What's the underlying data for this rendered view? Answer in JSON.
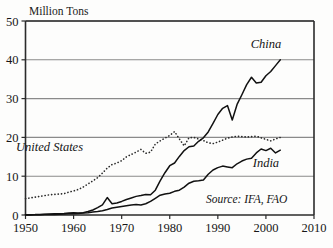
{
  "chart_data": {
    "type": "line",
    "title": "Million Tons",
    "xlabel": "",
    "ylabel": "Million Tons",
    "xlim": [
      1950,
      2010
    ],
    "ylim": [
      0,
      50
    ],
    "xticks": [
      "1950",
      "1960",
      "1970",
      "1980",
      "1990",
      "2000",
      "2010"
    ],
    "yticks": [
      "0",
      "10",
      "20",
      "30",
      "40",
      "50"
    ],
    "grid": true,
    "legend_position": "inline-annotations",
    "annotations": [
      {
        "text": "China",
        "x": 2000,
        "y": 43
      },
      {
        "text": "United States",
        "x": 1955,
        "y": 16.5
      },
      {
        "text": "India",
        "x": 2000,
        "y": 12.5
      },
      {
        "text": "Source: IFA, FAO",
        "x": 1996,
        "y": 3.0
      }
    ],
    "series": [
      {
        "name": "United States",
        "style": "dotted",
        "x": [
          1950,
          1951,
          1952,
          1953,
          1954,
          1955,
          1956,
          1957,
          1958,
          1959,
          1960,
          1961,
          1962,
          1963,
          1964,
          1965,
          1966,
          1967,
          1968,
          1969,
          1970,
          1971,
          1972,
          1973,
          1974,
          1975,
          1976,
          1977,
          1978,
          1979,
          1980,
          1981,
          1982,
          1983,
          1984,
          1985,
          1986,
          1987,
          1988,
          1989,
          1990,
          1991,
          1992,
          1993,
          1994,
          1995,
          1996,
          1997,
          1998,
          1999,
          2000,
          2001,
          2002,
          2003
        ],
        "values": [
          4.2,
          4.4,
          4.6,
          4.8,
          5.0,
          5.2,
          5.3,
          5.4,
          5.5,
          5.9,
          6.2,
          6.6,
          7.2,
          8.0,
          8.8,
          9.6,
          10.8,
          12.1,
          13.0,
          13.4,
          14.0,
          15.0,
          15.6,
          16.2,
          16.9,
          15.9,
          16.2,
          18.3,
          19.1,
          19.8,
          20.5,
          21.5,
          19.6,
          17.8,
          19.9,
          20.0,
          19.6,
          19.2,
          18.6,
          18.4,
          18.8,
          19.3,
          19.8,
          20.1,
          20.3,
          20.2,
          20.1,
          20.2,
          20.3,
          19.9,
          19.5,
          19.1,
          19.6,
          20.0
        ]
      },
      {
        "name": "China",
        "style": "solid",
        "x": [
          1950,
          1951,
          1952,
          1953,
          1954,
          1955,
          1956,
          1957,
          1958,
          1959,
          1960,
          1961,
          1962,
          1963,
          1964,
          1965,
          1966,
          1967,
          1968,
          1969,
          1970,
          1971,
          1972,
          1973,
          1974,
          1975,
          1976,
          1977,
          1978,
          1979,
          1980,
          1981,
          1982,
          1983,
          1984,
          1985,
          1986,
          1987,
          1988,
          1989,
          1990,
          1991,
          1992,
          1993,
          1994,
          1995,
          1996,
          1997,
          1998,
          1999,
          2000,
          2001,
          2002,
          2003
        ],
        "values": [
          0.05,
          0.08,
          0.1,
          0.15,
          0.2,
          0.25,
          0.3,
          0.35,
          0.4,
          0.5,
          0.6,
          0.5,
          0.6,
          0.9,
          1.3,
          1.9,
          2.6,
          4.5,
          2.9,
          3.1,
          3.5,
          4.0,
          4.4,
          4.8,
          5.0,
          5.3,
          5.2,
          6.4,
          8.8,
          10.9,
          12.7,
          13.4,
          15.1,
          16.6,
          17.6,
          17.8,
          19.0,
          19.9,
          21.4,
          23.6,
          25.9,
          27.5,
          28.2,
          24.5,
          28.5,
          31.0,
          33.6,
          35.5,
          34.0,
          34.2,
          35.9,
          37.0,
          38.5,
          40.0
        ]
      },
      {
        "name": "India",
        "style": "solid",
        "x": [
          1950,
          1951,
          1952,
          1953,
          1954,
          1955,
          1956,
          1957,
          1958,
          1959,
          1960,
          1961,
          1962,
          1963,
          1964,
          1965,
          1966,
          1967,
          1968,
          1969,
          1970,
          1971,
          1972,
          1973,
          1974,
          1975,
          1976,
          1977,
          1978,
          1979,
          1980,
          1981,
          1982,
          1983,
          1984,
          1985,
          1986,
          1987,
          1988,
          1989,
          1990,
          1991,
          1992,
          1993,
          1994,
          1995,
          1996,
          1997,
          1998,
          1999,
          2000,
          2001,
          2002,
          2003
        ],
        "values": [
          0.02,
          0.03,
          0.05,
          0.07,
          0.1,
          0.13,
          0.16,
          0.2,
          0.25,
          0.3,
          0.35,
          0.4,
          0.5,
          0.6,
          0.8,
          0.9,
          1.1,
          1.4,
          1.8,
          2.0,
          2.2,
          2.4,
          2.6,
          2.7,
          2.6,
          2.9,
          3.5,
          4.3,
          5.1,
          5.4,
          5.6,
          6.1,
          6.4,
          7.2,
          8.2,
          8.7,
          8.8,
          9.0,
          10.5,
          11.6,
          12.2,
          12.6,
          12.4,
          12.2,
          13.2,
          13.9,
          14.4,
          14.6,
          16.0,
          17.0,
          16.6,
          17.2,
          16.0,
          16.7
        ]
      }
    ]
  }
}
